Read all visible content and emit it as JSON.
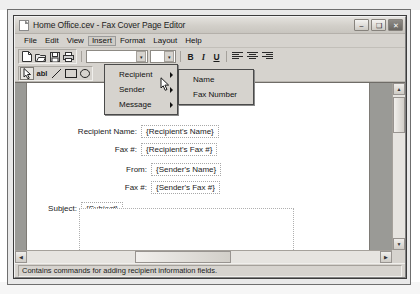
{
  "window": {
    "title": "Home Office.cev - Fax Cover Page Editor",
    "icon": "document-icon",
    "minimize_label": "–",
    "maximize_label": "❑",
    "close_label": "✕"
  },
  "menubar": {
    "items": [
      {
        "label": "File",
        "active": false
      },
      {
        "label": "Edit",
        "active": false
      },
      {
        "label": "View",
        "active": false
      },
      {
        "label": "Insert",
        "active": true
      },
      {
        "label": "Format",
        "active": false
      },
      {
        "label": "Layout",
        "active": false
      },
      {
        "label": "Help",
        "active": false
      }
    ]
  },
  "toolbar": {
    "file_buttons": [
      {
        "name": "new-document-button",
        "glyph": "\u0000"
      },
      {
        "name": "open-folder-button",
        "glyph": "\u0000"
      },
      {
        "name": "save-button",
        "glyph": "\u0000"
      },
      {
        "name": "print-button",
        "glyph": "\u0000"
      }
    ],
    "font_name": "",
    "font_size": "",
    "bold_label": "B",
    "italic_label": "I",
    "underline_label": "U",
    "align_left_label": "align-left",
    "align_center_label": "align-center",
    "align_right_label": "align-right"
  },
  "draw_toolbar": {
    "select_tool": "select-pointer",
    "text_tool": "abl",
    "line_tool": "line",
    "rect_tool": "rectangle"
  },
  "insert_menu": {
    "items": [
      {
        "label": "Recipient",
        "has_submenu": true
      },
      {
        "label": "Sender",
        "has_submenu": true
      },
      {
        "label": "Message",
        "has_submenu": true
      }
    ]
  },
  "recipient_submenu": {
    "items": [
      {
        "label": "Name"
      },
      {
        "label": "Fax Number"
      }
    ]
  },
  "document": {
    "fields": [
      {
        "label": "Recipient Name:",
        "value": "{Recipient's Name}"
      },
      {
        "label": "Fax #:",
        "value": "{Recipient's Fax #}"
      },
      {
        "label": "From:",
        "value": "{Sender's Name}"
      },
      {
        "label": "Fax #:",
        "value": "{Sender's Fax #}"
      },
      {
        "label": "Subject:",
        "value": "{Subject}"
      }
    ]
  },
  "statusbar": {
    "text": "Contains commands for adding recipient information fields."
  },
  "scrollbars": {
    "up_arrow": "▲",
    "down_arrow": "▼",
    "left_arrow": "◀",
    "right_arrow": "▶"
  }
}
